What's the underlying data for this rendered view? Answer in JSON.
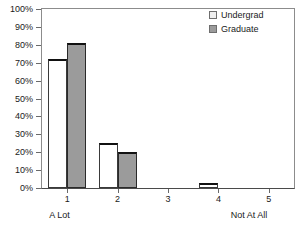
{
  "chart_data": {
    "type": "bar",
    "title": "",
    "subtitle": "",
    "xlabel": "",
    "ylabel": "",
    "categories": [
      "1",
      "2",
      "3",
      "4",
      "5"
    ],
    "category_endcaps": {
      "low": "A Lot",
      "high": "Not At All"
    },
    "series": [
      {
        "name": "Undergrad",
        "values": [
          72,
          25,
          0,
          3,
          0
        ],
        "color": "#ffffff"
      },
      {
        "name": "Graduate",
        "values": [
          81,
          20,
          0,
          0,
          0
        ],
        "color": "#9b9b9b"
      }
    ],
    "ylim": [
      0,
      100
    ],
    "ytick_values": [
      0,
      10,
      20,
      30,
      40,
      50,
      60,
      70,
      80,
      90,
      100
    ],
    "ytick_labels": [
      "0%",
      "10%",
      "20%",
      "30%",
      "40%",
      "50%",
      "60%",
      "70%",
      "80%",
      "90%",
      "100%"
    ],
    "grid": false,
    "legend_position": "top-right",
    "value_suffix": "%"
  },
  "legend": {
    "entries": [
      {
        "label": "Undergrad",
        "swatch": "legend-swatch-undergrad"
      },
      {
        "label": "Graduate",
        "swatch": "legend-swatch-graduate"
      }
    ]
  },
  "axes": {
    "y_labels": [
      "100%",
      "90%",
      "80%",
      "70%",
      "60%",
      "50%",
      "40%",
      "30%",
      "20%",
      "10%",
      "0%"
    ],
    "x_labels": [
      "1",
      "2",
      "3",
      "4",
      "5"
    ],
    "x_low_label": "A Lot",
    "x_high_label": "Not At All"
  },
  "colors": {
    "undergrad_fill": "#ffffff",
    "graduate_fill": "#9b9b9b",
    "bar_outline": "#2a2a2a",
    "frame": "#8c8c8c",
    "text": "#1a1a1a"
  }
}
